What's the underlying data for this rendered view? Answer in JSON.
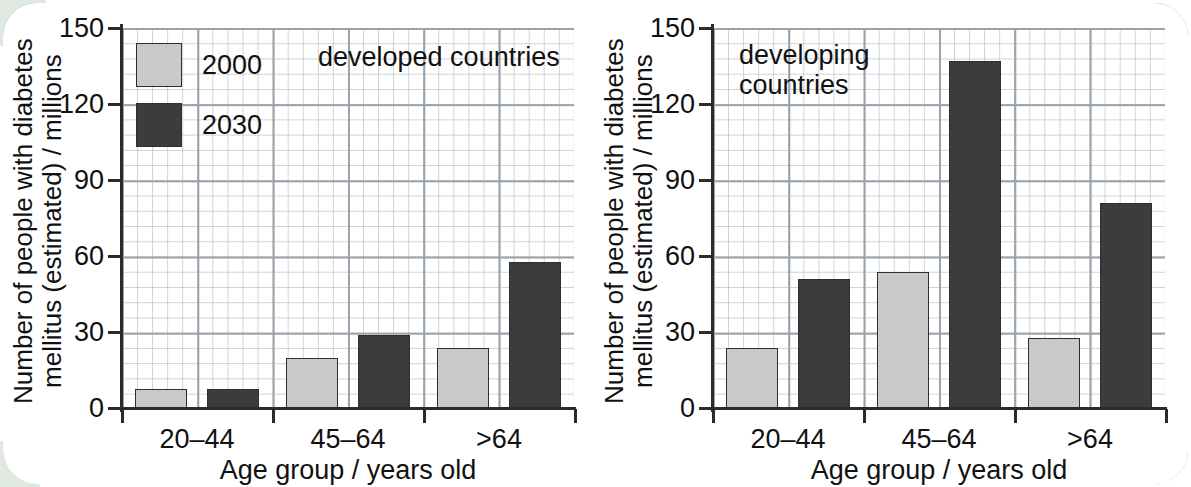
{
  "figure": {
    "legend": {
      "items": [
        {
          "label": "2000",
          "color": "#c9c9c9",
          "key": "y2000"
        },
        {
          "label": "2030",
          "color": "#3c3c3c",
          "key": "y2030"
        }
      ]
    },
    "colors": {
      "series_2000": "#c9c9c9",
      "series_2030": "#3c3c3c",
      "bar_outline": "#2e2e2e",
      "axis": "#2b2b2b",
      "grid_major": "#9aa3ab",
      "grid_minor": "#b9c0c8",
      "frame_border": "#8fb09a",
      "text": "#111111"
    }
  },
  "chart_data": [
    {
      "type": "bar",
      "id": "developed-countries",
      "title": "developed countries",
      "xlabel": "Age group / years old",
      "ylabel": "Number of people with diabetes\nmellitus (estimated) / millions",
      "categories": [
        "20–44",
        "45–64",
        ">64"
      ],
      "series": [
        {
          "name": "2000",
          "values": [
            8,
            20,
            24
          ]
        },
        {
          "name": "2030",
          "values": [
            8,
            29,
            58
          ]
        }
      ],
      "ylim": [
        0,
        150
      ],
      "yticks": [
        0,
        30,
        60,
        90,
        120,
        150
      ],
      "grid": true,
      "legend_position": "top-left"
    },
    {
      "type": "bar",
      "id": "developing-countries",
      "title": "developing\ncountries",
      "xlabel": "Age group / years old",
      "ylabel": "Number of people with diabetes\nmellitus (estimated) / millions",
      "categories": [
        "20–44",
        "45–64",
        ">64"
      ],
      "series": [
        {
          "name": "2000",
          "values": [
            24,
            54,
            28
          ]
        },
        {
          "name": "2030",
          "values": [
            51,
            137,
            81
          ]
        }
      ],
      "ylim": [
        0,
        150
      ],
      "yticks": [
        0,
        30,
        60,
        90,
        120,
        150
      ],
      "grid": true,
      "legend_position": "none"
    }
  ]
}
